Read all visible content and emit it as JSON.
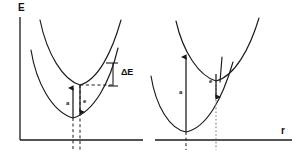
{
  "figure": {
    "background_color": "#ffffff",
    "line_color": "#1a1a1a",
    "axes": {
      "y_label": "E",
      "x_label": "r",
      "y_axis_name": "energy-axis",
      "x_axis_name": "configuration-coordinate-axis"
    },
    "panels": [
      {
        "id": "left",
        "name": "small-stokes-shift-panel",
        "curves": [
          {
            "name": "ground-state-parabola",
            "role": "ground state"
          },
          {
            "name": "excited-state-parabola",
            "role": "excited state"
          }
        ],
        "transitions": [
          {
            "label": "a",
            "name": "absorption-arrow",
            "direction": "up",
            "meaning": "absorption"
          },
          {
            "label": "e",
            "name": "emission-arrow",
            "direction": "down",
            "meaning": "emission"
          }
        ],
        "annotations": [
          {
            "label": "ΔE",
            "name": "delta-e-bracket-label",
            "meaning": "Stokes shift"
          }
        ],
        "guides": [
          {
            "name": "ground-minimum-dashed-line",
            "style": "dashed"
          },
          {
            "name": "excited-minimum-dashed-line",
            "style": "dashed"
          },
          {
            "name": "delta-e-horizontal-dashed-line",
            "style": "dashed"
          }
        ]
      },
      {
        "id": "right",
        "name": "large-stokes-shift-panel",
        "curves": [
          {
            "name": "ground-state-parabola",
            "role": "ground state"
          },
          {
            "name": "excited-state-parabola",
            "role": "excited state"
          }
        ],
        "transitions": [
          {
            "label": "a",
            "name": "absorption-arrow",
            "direction": "up",
            "meaning": "absorption"
          },
          {
            "label": "e",
            "name": "emission-arrow",
            "direction": "down",
            "meaning": "emission"
          }
        ],
        "annotations": [],
        "guides": [
          {
            "name": "ground-minimum-dashed-line",
            "style": "dashed"
          },
          {
            "name": "excited-minimum-dotted-line",
            "style": "dotted"
          }
        ]
      }
    ]
  },
  "labels": {
    "energy_axis": "E",
    "coordinate_axis": "r",
    "delta_e": "ΔE",
    "absorption_left": "a",
    "emission_left": "e",
    "absorption_right": "a",
    "emission_right": "e"
  }
}
